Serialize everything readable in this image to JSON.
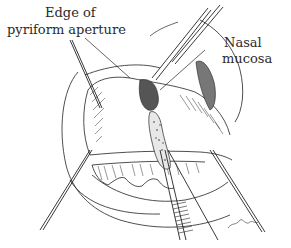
{
  "figure": {
    "type": "surgical line illustration",
    "labels": [
      {
        "id": "edge_line1",
        "text": "Edge of"
      },
      {
        "id": "edge_line2",
        "text": "pyriform aperture"
      },
      {
        "id": "mucosa_line1",
        "text": "Nasal"
      },
      {
        "id": "mucosa_line2",
        "text": "mucosa"
      }
    ],
    "signature": "P.Blake",
    "colors": {
      "ink": "#222222",
      "paper": "#ffffff",
      "shade": "#555555"
    }
  }
}
